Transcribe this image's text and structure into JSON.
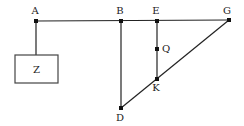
{
  "diagram": {
    "type": "geometry-figure",
    "colors": {
      "line": "#222222",
      "point": "#111111",
      "background": "#ffffff"
    },
    "points": [
      {
        "id": "A",
        "label": "A",
        "x": 36,
        "y": 21,
        "label_dx": -1,
        "label_dy": -7
      },
      {
        "id": "B",
        "label": "B",
        "x": 121,
        "y": 21,
        "label_dx": -1,
        "label_dy": -7
      },
      {
        "id": "E",
        "label": "E",
        "x": 157,
        "y": 21,
        "label_dx": -1,
        "label_dy": -7
      },
      {
        "id": "G",
        "label": "G",
        "x": 229,
        "y": 20,
        "label_dx": -2,
        "label_dy": -6
      },
      {
        "id": "Q",
        "label": "Q",
        "x": 157,
        "y": 49,
        "label_dx": 9,
        "label_dy": 3
      },
      {
        "id": "K",
        "label": "K",
        "x": 157,
        "y": 79,
        "label_dx": -1,
        "label_dy": 12
      },
      {
        "id": "D",
        "label": "D",
        "x": 121,
        "y": 108,
        "label_dx": -1,
        "label_dy": 13
      }
    ],
    "segments": [
      {
        "from": "A",
        "to": "G"
      },
      {
        "from": "B",
        "to": "D"
      },
      {
        "from": "E",
        "to": "K"
      },
      {
        "from": "G",
        "to": "D"
      },
      {
        "from": "A",
        "to": "box_top"
      }
    ],
    "box": {
      "label": "Z",
      "x": 15,
      "y": 55,
      "width": 43,
      "height": 28,
      "attach_x": 36
    }
  }
}
